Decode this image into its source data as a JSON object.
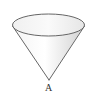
{
  "figure": {
    "type": "cone",
    "apex_label": "A",
    "clipped_top_text": "",
    "colors": {
      "stroke": "#555555",
      "fill_light": "#ffffff",
      "fill_shade": "#dcdcdc",
      "label": "#333333"
    }
  }
}
